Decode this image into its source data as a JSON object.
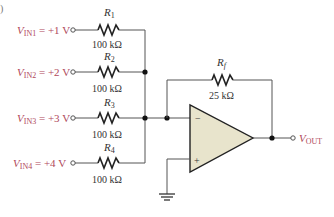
{
  "figure_marker": ")",
  "inputs": [
    {
      "label_main": "V",
      "label_sub": "IN1",
      "label_value": " = +1 V",
      "resistor_name": "R",
      "resistor_sub": "1",
      "resistor_value": "100 kΩ"
    },
    {
      "label_main": "V",
      "label_sub": "IN2",
      "label_value": " = +2 V",
      "resistor_name": "R",
      "resistor_sub": "2",
      "resistor_value": "100 kΩ"
    },
    {
      "label_main": "V",
      "label_sub": "IN3",
      "label_value": " = +3 V",
      "resistor_name": "R",
      "resistor_sub": "3",
      "resistor_value": "100 kΩ"
    },
    {
      "label_main": "V",
      "label_sub": "IN4",
      "label_value": " = +4 V",
      "resistor_name": "R",
      "resistor_sub": "4",
      "resistor_value": "100 kΩ"
    }
  ],
  "feedback": {
    "name": "R",
    "sub": "f",
    "value": "25 kΩ"
  },
  "opamp": {
    "inverting": "−",
    "noninverting": "+"
  },
  "output": {
    "main": "V",
    "sub": "OUT"
  },
  "colors": {
    "label": "#b0485a",
    "opamp_fill": "#e8e4cc",
    "wire": "#555555"
  }
}
